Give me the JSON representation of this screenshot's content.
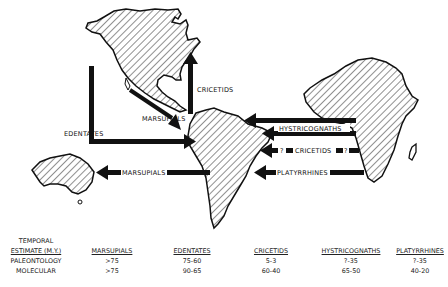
{
  "diagram": {
    "regions": [
      {
        "name": "North America",
        "fill": "hatched"
      },
      {
        "name": "South America",
        "fill": "hatched"
      },
      {
        "name": "Africa",
        "fill": "hatched"
      },
      {
        "name": "Australia",
        "fill": "hatched"
      },
      {
        "name": "Madagascar",
        "fill": "outline"
      }
    ],
    "arrows": [
      {
        "label": "CRICETIDS",
        "from": "North America",
        "to": "South America"
      },
      {
        "label": "MARSUPIALS",
        "from": "North America",
        "to": "South America"
      },
      {
        "label": "EDENTATES",
        "from": "North America",
        "to": "South America"
      },
      {
        "label": "MARSUPIALS",
        "from": "South America",
        "to": "Australia"
      },
      {
        "label": "HYSTRICOGNATHS",
        "from": "Africa",
        "to": "South America"
      },
      {
        "label": "? CRICETIDS ?",
        "from": "Africa",
        "to": "South America"
      },
      {
        "label": "PLATYRRHINES",
        "from": "Africa",
        "to": "South America"
      }
    ],
    "labels": {
      "cricetids_na": "CRICETIDS",
      "marsupials_na": "MARSUPIALS",
      "edentates": "EDENTATES",
      "marsupials_aus": "MARSUPIALS",
      "hystricognaths": "HYSTRICOGNATHS",
      "q1": "?",
      "cricetids_af": "CRICETIDS",
      "q2": "?",
      "platyrrhines": "PLATYRRHINES"
    },
    "colors": {
      "ink": "#111111",
      "background": "#ffffff"
    }
  },
  "table": {
    "row_header_line1": "TEMPORAL",
    "row_header_line2": "ESTIMATE (M.Y.)",
    "columns": [
      "MARSUPIALS",
      "EDENTATES",
      "CRICETIDS",
      "HYSTRICOGNATHS",
      "PLATYRRHINES"
    ],
    "rows": [
      {
        "label": "PALEONTOLOGY",
        "values": [
          ">75",
          "75-60",
          "5-3",
          "?-35",
          "?-35"
        ]
      },
      {
        "label": "MOLECULAR",
        "values": [
          ">75",
          "90-65",
          "60-40",
          "65-50",
          "40-20"
        ]
      }
    ]
  }
}
